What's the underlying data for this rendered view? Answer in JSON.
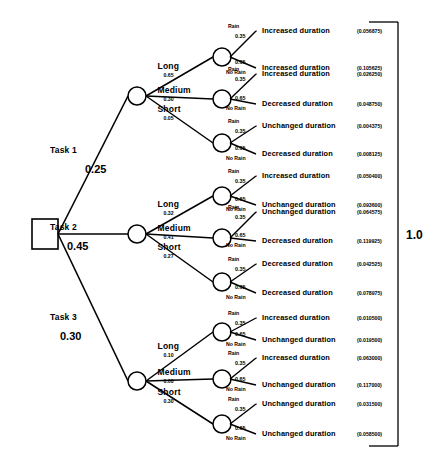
{
  "diagram": {
    "type": "probability-decision-tree",
    "root_node": "decision",
    "total_label": "1.0",
    "rain_label": "Rain",
    "no_rain_label": "No Rain",
    "rain_prob": "0.35",
    "no_rain_prob": "0.65"
  },
  "chart_data": {
    "type": "tree",
    "title": "",
    "root": "decision",
    "total": 1.0,
    "branches": [
      {
        "name": "Task 1",
        "prob": "0.25",
        "durations": [
          {
            "name": "Long",
            "prob": "0.65",
            "leaves": [
              {
                "weather": "Rain",
                "wprob": "0.35",
                "outcome": "Increased duration",
                "value": "(0.056875)"
              },
              {
                "weather": "No Rain",
                "wprob": "0.65",
                "outcome": "Increased duration",
                "value": "(0.105625)"
              }
            ]
          },
          {
            "name": "Medium",
            "prob": "0.30",
            "leaves": [
              {
                "weather": "Rain",
                "wprob": "0.35",
                "outcome": "Increased duration",
                "value": "(0.026250)"
              },
              {
                "weather": "No Rain",
                "wprob": "0.65",
                "outcome": "Decreased duration",
                "value": "(0.048750)"
              }
            ]
          },
          {
            "name": "Short",
            "prob": "0.05",
            "leaves": [
              {
                "weather": "Rain",
                "wprob": "0.35",
                "outcome": "Unchanged duration",
                "value": "(0.004375)"
              },
              {
                "weather": "No Rain",
                "wprob": "0.65",
                "outcome": "Decreased duration",
                "value": "(0.008125)"
              }
            ]
          }
        ]
      },
      {
        "name": "Task 2",
        "prob": "0.45",
        "durations": [
          {
            "name": "Long",
            "prob": "0.32",
            "leaves": [
              {
                "weather": "Rain",
                "wprob": "0.35",
                "outcome": "Increased duration",
                "value": "(0.050400)"
              },
              {
                "weather": "No Rain",
                "wprob": "0.65",
                "outcome": "Unchanged duration",
                "value": "(0.093600)"
              }
            ]
          },
          {
            "name": "Medium",
            "prob": "0.41",
            "leaves": [
              {
                "weather": "Rain",
                "wprob": "0.35",
                "outcome": "Unchanged duration",
                "value": "(0.064575)"
              },
              {
                "weather": "No Rain",
                "wprob": "0.65",
                "outcome": "Decreased duration",
                "value": "(0.119925)"
              }
            ]
          },
          {
            "name": "Short",
            "prob": "0.27",
            "leaves": [
              {
                "weather": "Rain",
                "wprob": "0.35",
                "outcome": "Decreased duration",
                "value": "(0.042525)"
              },
              {
                "weather": "No Rain",
                "wprob": "0.65",
                "outcome": "Decreased duration",
                "value": "(0.078975)"
              }
            ]
          }
        ]
      },
      {
        "name": "Task 3",
        "prob": "0.30",
        "durations": [
          {
            "name": "Long",
            "prob": "0.10",
            "leaves": [
              {
                "weather": "Rain",
                "wprob": "0.35",
                "outcome": "Increased duration",
                "value": "(0.010500)"
              },
              {
                "weather": "No Rain",
                "wprob": "0.65",
                "outcome": "Unchanged duration",
                "value": "(0.019500)"
              }
            ]
          },
          {
            "name": "Medium",
            "prob": "0.60",
            "leaves": [
              {
                "weather": "Rain",
                "wprob": "0.35",
                "outcome": "Increased duration",
                "value": "(0.063000)"
              },
              {
                "weather": "No Rain",
                "wprob": "0.65",
                "outcome": "Unchanged duration",
                "value": "(0.117000)"
              }
            ]
          },
          {
            "name": "Short",
            "prob": "0.30",
            "leaves": [
              {
                "weather": "Rain",
                "wprob": "0.35",
                "outcome": "Unchanged duration",
                "value": "(0.031500)"
              },
              {
                "weather": "No Rain",
                "wprob": "0.65",
                "outcome": "Unchanged duration",
                "value": "(0.058500)"
              }
            ]
          }
        ]
      }
    ]
  }
}
